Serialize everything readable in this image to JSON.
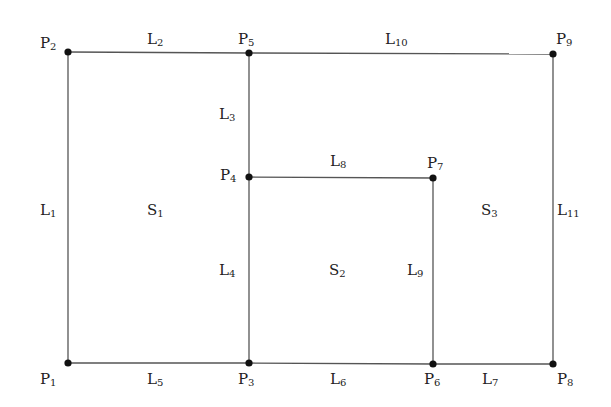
{
  "diagram": {
    "line_color": "#555555",
    "point_color": "#111111",
    "points": [
      {
        "id": "P1",
        "base": "P",
        "sub": "1",
        "x": 68,
        "y": 363,
        "lx": 40,
        "ly": 372
      },
      {
        "id": "P2",
        "base": "P",
        "sub": "2",
        "x": 68,
        "y": 52,
        "lx": 40,
        "ly": 36
      },
      {
        "id": "P3",
        "base": "P",
        "sub": "3",
        "x": 249,
        "y": 363,
        "lx": 238,
        "ly": 372
      },
      {
        "id": "P4",
        "base": "P",
        "sub": "4",
        "x": 249,
        "y": 177,
        "lx": 220,
        "ly": 168
      },
      {
        "id": "P5",
        "base": "P",
        "sub": "5",
        "x": 249,
        "y": 53,
        "lx": 238,
        "ly": 32
      },
      {
        "id": "P6",
        "base": "P",
        "sub": "6",
        "x": 433,
        "y": 364,
        "lx": 424,
        "ly": 372
      },
      {
        "id": "P7",
        "base": "P",
        "sub": "7",
        "x": 433,
        "y": 178,
        "lx": 427,
        "ly": 156
      },
      {
        "id": "P8",
        "base": "P",
        "sub": "8",
        "x": 553,
        "y": 364,
        "lx": 557,
        "ly": 372
      },
      {
        "id": "P9",
        "base": "P",
        "sub": "9",
        "x": 553,
        "y": 54,
        "lx": 556,
        "ly": 32
      }
    ],
    "lines": [
      {
        "id": "L1",
        "base": "L",
        "sub": "1",
        "from": "P1",
        "to": "P2",
        "lx": 40,
        "ly": 203
      },
      {
        "id": "L2",
        "base": "L",
        "sub": "2",
        "from": "P2",
        "to": "P5",
        "lx": 147,
        "ly": 32
      },
      {
        "id": "L3",
        "base": "L",
        "sub": "3",
        "from": "P5",
        "to": "P4",
        "lx": 219,
        "ly": 107
      },
      {
        "id": "L4",
        "base": "L",
        "sub": "4",
        "from": "P4",
        "to": "P3",
        "lx": 219,
        "ly": 263
      },
      {
        "id": "L5",
        "base": "L",
        "sub": "5",
        "from": "P1",
        "to": "P3",
        "lx": 147,
        "ly": 372
      },
      {
        "id": "L6",
        "base": "L",
        "sub": "6",
        "from": "P3",
        "to": "P6",
        "lx": 330,
        "ly": 372
      },
      {
        "id": "L7",
        "base": "L",
        "sub": "7",
        "from": "P6",
        "to": "P8",
        "lx": 482,
        "ly": 372
      },
      {
        "id": "L8",
        "base": "L",
        "sub": "8",
        "from": "P4",
        "to": "P7",
        "lx": 330,
        "ly": 154
      },
      {
        "id": "L9",
        "base": "L",
        "sub": "9",
        "from": "P7",
        "to": "P6",
        "lx": 407,
        "ly": 263
      },
      {
        "id": "L10",
        "base": "L",
        "sub": "10",
        "from": "P5",
        "to": "P9",
        "lx": 385,
        "ly": 32
      },
      {
        "id": "L11",
        "base": "L",
        "sub": "11",
        "from": "P9",
        "to": "P8",
        "lx": 557,
        "ly": 203
      }
    ],
    "surfaces": [
      {
        "id": "S1",
        "base": "S",
        "sub": "1",
        "lx": 147,
        "ly": 203
      },
      {
        "id": "S2",
        "base": "S",
        "sub": "2",
        "lx": 329,
        "ly": 263
      },
      {
        "id": "S3",
        "base": "S",
        "sub": "3",
        "lx": 481,
        "ly": 203
      }
    ]
  }
}
